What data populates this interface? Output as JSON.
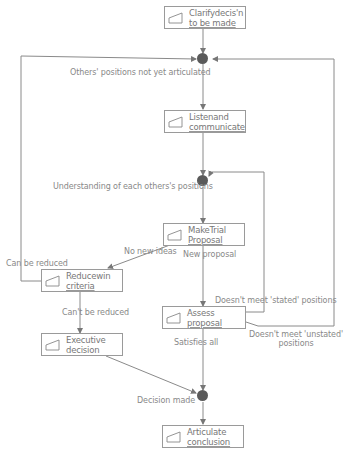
{
  "diagram": {
    "type": "flowchart",
    "nodes": [
      {
        "id": "clarify",
        "line1": "Clarifydecis'n",
        "line2": "to be made"
      },
      {
        "id": "listen",
        "line1": "Listenand",
        "line2": "communicate"
      },
      {
        "id": "trial",
        "line1": "MakeTrial",
        "line2": "Proposal"
      },
      {
        "id": "reduce",
        "line1": "Reducewin",
        "line2": "criteria"
      },
      {
        "id": "assess",
        "line1": "Assess",
        "line2": "proposal"
      },
      {
        "id": "executive",
        "line1": "Executive",
        "line2": "decision"
      },
      {
        "id": "articulate",
        "line1": "Articulate",
        "line2": "conclusion"
      }
    ],
    "junctions": [
      {
        "id": "j1",
        "label": "Others' positions not yet articulated"
      },
      {
        "id": "j2",
        "label": "Understanding of each others's positions"
      },
      {
        "id": "j3",
        "label": "Decision made"
      }
    ],
    "edge_labels": {
      "no_new_ideas": "No new ideas",
      "new_proposal": "New proposal",
      "can_be_reduced": "Can be reduced",
      "cant_be_reduced": "Can't be reduced",
      "doesnt_meet_stated": "Doesn't meet 'stated' positions",
      "doesnt_meet_unstated_1": "Doesn't meet 'unstated'",
      "doesnt_meet_unstated_2": "positions",
      "satisfies_all": "Satisfies all"
    },
    "colors": {
      "line": "#8a8a8a",
      "junction": "#5a5a5a",
      "box_border": "#9a9a9a",
      "text": "#777777"
    }
  }
}
